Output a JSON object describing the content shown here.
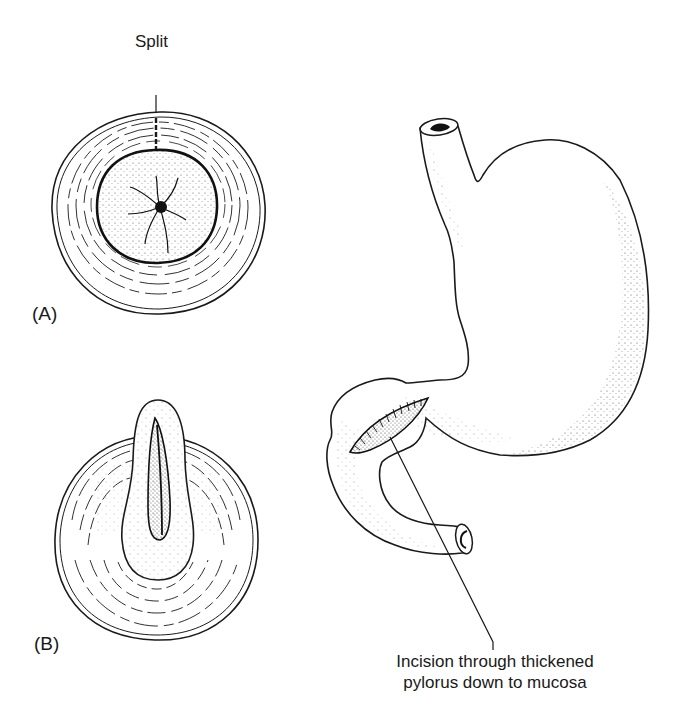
{
  "figure": {
    "panel_a": {
      "label": "(A)",
      "annotation": "Split"
    },
    "panel_b": {
      "label": "(B)"
    },
    "stomach": {
      "caption_line1": "Incision through thickened",
      "caption_line2": "pylorus down to mucosa"
    }
  },
  "colors": {
    "ink": "#1a1a1a",
    "background": "#ffffff",
    "stipple": "#555555"
  }
}
